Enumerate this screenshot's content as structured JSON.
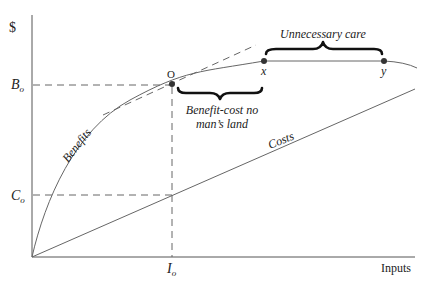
{
  "diagram": {
    "y_axis_label": "$",
    "x_axis_label": "Inputs",
    "y_ticks": {
      "b0": {
        "main": "B",
        "sub": "o"
      },
      "c0": {
        "main": "C",
        "sub": "o"
      }
    },
    "x_ticks": {
      "i0": {
        "main": "I",
        "sub": "o"
      }
    },
    "curves": {
      "benefits": "Benefits",
      "costs": "Costs"
    },
    "points": {
      "optimum": "O",
      "x": "x",
      "y": "y"
    },
    "annotations": {
      "no_mans_land_line1": "Benefit-cost no",
      "no_mans_land_line2": "man’s land",
      "unnecessary_care": "Unnecessary care"
    },
    "colors": {
      "lines": "#666666",
      "text": "#222222",
      "braces": "#111111"
    }
  }
}
